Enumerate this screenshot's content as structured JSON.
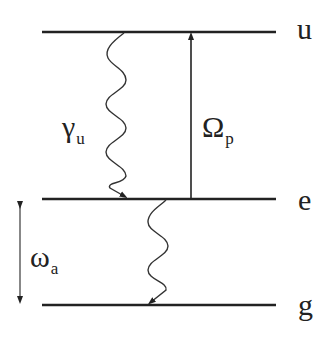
{
  "diagram": {
    "type": "energy-level-diagram",
    "colors": {
      "line": "#222222",
      "background": "#ffffff"
    },
    "levels": [
      {
        "id": "u",
        "label": "u",
        "y": 32
      },
      {
        "id": "e",
        "label": "e",
        "y": 199
      },
      {
        "id": "g",
        "label": "g",
        "y": 305
      }
    ],
    "transitions": [
      {
        "id": "decay-u-e",
        "kind": "wavy-arrow",
        "from": "u",
        "to": "e",
        "symbol": "γ",
        "subscript": "u"
      },
      {
        "id": "pump-e-u",
        "kind": "straight-arrow",
        "from": "e",
        "to": "u",
        "symbol": "Ω",
        "subscript": "p"
      },
      {
        "id": "decay-e-g",
        "kind": "wavy-arrow",
        "from": "e",
        "to": "g",
        "symbol": "",
        "subscript": ""
      }
    ],
    "spacing": {
      "kind": "double-arrow",
      "between": [
        "e",
        "g"
      ],
      "symbol": "ω",
      "subscript": "a"
    }
  }
}
